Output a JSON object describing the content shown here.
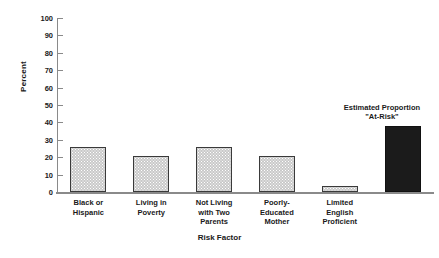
{
  "chart_data": {
    "type": "bar",
    "title": "",
    "xlabel": "Risk Factor",
    "ylabel": "Percent",
    "ylim": [
      0,
      100
    ],
    "ytick_step": 10,
    "yticks": [
      "100",
      "90",
      "80",
      "70",
      "60",
      "50",
      "40",
      "30",
      "20",
      "10",
      "0"
    ],
    "grid": false,
    "legend": "none",
    "categories": [
      "Black or\nHispanic",
      "Living in\nPoverty",
      "Not Living\nwith Two\nParents",
      "Poorly-\nEducated\nMother",
      "Limited\nEnglish\nProficient",
      ""
    ],
    "values": [
      26,
      20.5,
      26,
      20.5,
      3.5,
      38
    ],
    "bar_styles": [
      "dotted-gray",
      "dotted-gray",
      "dotted-gray",
      "dotted-gray",
      "dotted-gray",
      "solid-black"
    ],
    "annotations": [
      {
        "text": "Estimated Proportion\n\"At-Risk\"",
        "target_bar_index": 5
      }
    ]
  },
  "colors": {
    "bar_fill": "#c9c9c9",
    "bar_edge": "#3a3a3a",
    "highlight_bar": "#1b1b1b",
    "axis": "#8a8a8a",
    "text": "#1a1a1a",
    "background": "#ffffff"
  }
}
